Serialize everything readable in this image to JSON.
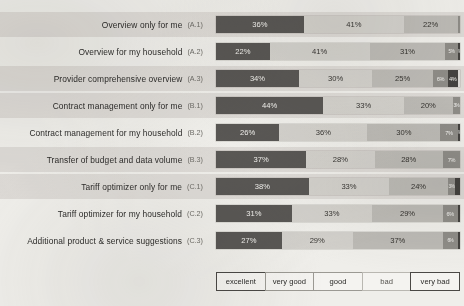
{
  "chart_data": {
    "type": "bar",
    "subtype": "stacked-horizontal-likert",
    "title": "",
    "xlabel": "",
    "ylabel": "",
    "xlim": [
      0,
      100
    ],
    "unit": "%",
    "grid": false,
    "legend_position": "bottom",
    "categories": [
      "Overview only for me",
      "Overview for my household",
      "Provider comprehensive overview",
      "Contract management only for me",
      "Contract management for my household",
      "Transfer of budget and data volume",
      "Tariff optimizer only for me",
      "Tariff optimizer for my household",
      "Additional product & service suggestions"
    ],
    "category_codes": [
      "(A.1)",
      "(A.2)",
      "(A.3)",
      "(B.1)",
      "(B.2)",
      "(B.3)",
      "(C.1)",
      "(C.2)",
      "(C.3)"
    ],
    "series": [
      {
        "name": "excellent",
        "color": "#595754",
        "values": [
          36,
          22,
          34,
          44,
          26,
          37,
          38,
          31,
          27
        ]
      },
      {
        "name": "very good",
        "color": "#d2d0cb",
        "values": [
          41,
          41,
          30,
          33,
          36,
          28,
          33,
          33,
          29
        ]
      },
      {
        "name": "good",
        "color": "#bcbab5",
        "values": [
          22,
          31,
          25,
          20,
          30,
          28,
          24,
          29,
          37
        ]
      },
      {
        "name": "bad",
        "color": "#8e8c87",
        "values": [
          1,
          5,
          6,
          3,
          7,
          7,
          3,
          6,
          6
        ]
      },
      {
        "name": "very bad",
        "color": "#44423f",
        "values": [
          0,
          1,
          4,
          0,
          1,
          0,
          2,
          1,
          1
        ]
      }
    ],
    "legend_entries": [
      "excellent",
      "very good",
      "good",
      "bad",
      "very bad"
    ]
  },
  "rows": [
    {
      "label": "Overview only for me",
      "code": "(A.1)",
      "band": true,
      "segments": [
        {
          "cls": "s-excellent",
          "v": 36,
          "t": "36%"
        },
        {
          "cls": "s-verygood",
          "v": 41,
          "t": "41%"
        },
        {
          "cls": "s-good",
          "v": 22,
          "t": "22%"
        },
        {
          "cls": "s-bad",
          "v": 1,
          "t": "",
          "size": "micro"
        },
        {
          "cls": "s-verybad",
          "v": 0,
          "t": "",
          "size": "micro"
        }
      ]
    },
    {
      "label": "Overview for my household",
      "code": "(A.2)",
      "band": false,
      "segments": [
        {
          "cls": "s-excellent",
          "v": 22,
          "t": "22%"
        },
        {
          "cls": "s-verygood",
          "v": 41,
          "t": "41%"
        },
        {
          "cls": "s-good",
          "v": 31,
          "t": "31%"
        },
        {
          "cls": "s-bad",
          "v": 5,
          "t": "5%",
          "size": "micro"
        },
        {
          "cls": "s-verybad",
          "v": 1,
          "t": "1%",
          "size": "micro"
        }
      ]
    },
    {
      "label": "Provider comprehensive overview",
      "code": "(A.3)",
      "band": true,
      "segments": [
        {
          "cls": "s-excellent",
          "v": 34,
          "t": "34%"
        },
        {
          "cls": "s-verygood",
          "v": 30,
          "t": "30%"
        },
        {
          "cls": "s-good",
          "v": 25,
          "t": "25%"
        },
        {
          "cls": "s-bad",
          "v": 6,
          "t": "6%",
          "size": "tiny"
        },
        {
          "cls": "s-verybad",
          "v": 4,
          "t": "4%",
          "size": "tiny"
        }
      ]
    },
    {
      "label": "Contract management only for me",
      "code": "(B.1)",
      "band": true,
      "segments": [
        {
          "cls": "s-excellent",
          "v": 44,
          "t": "44%"
        },
        {
          "cls": "s-verygood",
          "v": 33,
          "t": "33%"
        },
        {
          "cls": "s-good",
          "v": 20,
          "t": "20%"
        },
        {
          "cls": "s-bad",
          "v": 3,
          "t": "3%",
          "size": "micro"
        },
        {
          "cls": "s-verybad",
          "v": 0,
          "t": "",
          "size": "micro"
        }
      ]
    },
    {
      "label": "Contract management for my household",
      "code": "(B.2)",
      "band": false,
      "segments": [
        {
          "cls": "s-excellent",
          "v": 26,
          "t": "26%"
        },
        {
          "cls": "s-verygood",
          "v": 36,
          "t": "36%"
        },
        {
          "cls": "s-good",
          "v": 30,
          "t": "30%"
        },
        {
          "cls": "s-bad",
          "v": 7,
          "t": "7%",
          "size": "tiny"
        },
        {
          "cls": "s-verybad",
          "v": 1,
          "t": "1%",
          "size": "micro"
        }
      ]
    },
    {
      "label": "Transfer of budget and data volume",
      "code": "(B.3)",
      "band": true,
      "segments": [
        {
          "cls": "s-excellent",
          "v": 37,
          "t": "37%"
        },
        {
          "cls": "s-verygood",
          "v": 28,
          "t": "28%"
        },
        {
          "cls": "s-good",
          "v": 28,
          "t": "28%"
        },
        {
          "cls": "s-bad",
          "v": 7,
          "t": "7%",
          "size": "tiny"
        },
        {
          "cls": "s-verybad",
          "v": 0,
          "t": "",
          "size": "micro"
        }
      ]
    },
    {
      "label": "Tariff optimizer only for me",
      "code": "(C.1)",
      "band": true,
      "segments": [
        {
          "cls": "s-excellent",
          "v": 38,
          "t": "38%"
        },
        {
          "cls": "s-verygood",
          "v": 33,
          "t": "33%"
        },
        {
          "cls": "s-good",
          "v": 24,
          "t": "24%"
        },
        {
          "cls": "s-bad",
          "v": 3,
          "t": "3%",
          "size": "micro"
        },
        {
          "cls": "s-verybad",
          "v": 2,
          "t": "",
          "size": "micro"
        }
      ]
    },
    {
      "label": "Tariff optimizer for my household",
      "code": "(C.2)",
      "band": false,
      "segments": [
        {
          "cls": "s-excellent",
          "v": 31,
          "t": "31%"
        },
        {
          "cls": "s-verygood",
          "v": 33,
          "t": "33%"
        },
        {
          "cls": "s-good",
          "v": 29,
          "t": "29%"
        },
        {
          "cls": "s-bad",
          "v": 6,
          "t": "6%",
          "size": "tiny"
        },
        {
          "cls": "s-verybad",
          "v": 1,
          "t": "",
          "size": "micro"
        }
      ]
    },
    {
      "label": "Additional product & service suggestions",
      "code": "(C.3)",
      "band": false,
      "segments": [
        {
          "cls": "s-excellent",
          "v": 27,
          "t": "27%"
        },
        {
          "cls": "s-verygood",
          "v": 29,
          "t": "29%"
        },
        {
          "cls": "s-good",
          "v": 37,
          "t": "37%"
        },
        {
          "cls": "s-bad",
          "v": 6,
          "t": "6%",
          "size": "micro"
        },
        {
          "cls": "s-verybad",
          "v": 1,
          "t": "",
          "size": "micro"
        }
      ]
    }
  ],
  "legend": [
    {
      "label": "excellent",
      "style": "strong"
    },
    {
      "label": "very good",
      "style": "normal"
    },
    {
      "label": "good",
      "style": "normal"
    },
    {
      "label": "bad",
      "style": "light"
    },
    {
      "label": "very bad",
      "style": "strong"
    }
  ]
}
